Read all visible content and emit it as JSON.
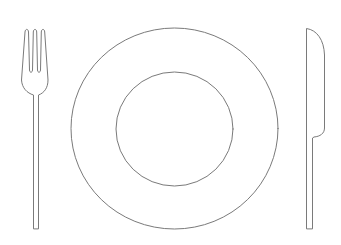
{
  "illustration": {
    "title": "Place setting",
    "background": "#ffffff",
    "stroke_color": "#7a7a7a",
    "items": [
      {
        "id": "fork",
        "label": "Fork"
      },
      {
        "id": "plate",
        "label": "Plate"
      },
      {
        "id": "knife",
        "label": "Knife"
      }
    ]
  }
}
